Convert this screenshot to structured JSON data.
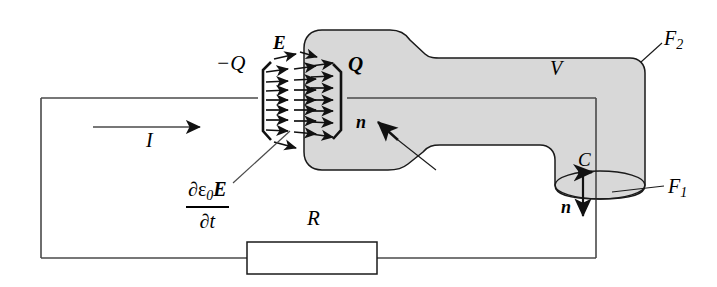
{
  "figure": {
    "type": "physics-circuit-diagram",
    "colors": {
      "line": "#1a1a1a",
      "volume_fill": "#d8d8d8",
      "background": "#ffffff"
    },
    "labels": {
      "charge_negative": "−Q",
      "charge_positive": "Q",
      "field": "E",
      "current": "I",
      "resistor": "R",
      "volume": "V",
      "surface_outer": "F",
      "surface_outer_sub": "2",
      "surface_inner": "F",
      "surface_inner_sub": "1",
      "curve": "C",
      "normal_upper": "n",
      "normal_lower": "n",
      "displacement_numerator_partial": "∂ε",
      "displacement_numerator_sub": "0",
      "displacement_numerator_field": "E",
      "displacement_denominator": "∂t"
    },
    "elements": [
      {
        "name": "circuit-loop",
        "shape": "rectangle",
        "role": "conducting wire loop"
      },
      {
        "name": "capacitor-plate-left",
        "charge": "−Q"
      },
      {
        "name": "capacitor-plate-right",
        "charge": "Q"
      },
      {
        "name": "electric-field-arrows",
        "count": 24,
        "direction": "left-to-right"
      },
      {
        "name": "resistor",
        "label": "R"
      },
      {
        "name": "current-arrow",
        "label": "I",
        "direction": "right"
      },
      {
        "name": "volume-region",
        "label": "V",
        "fill": "#d8d8d8"
      },
      {
        "name": "curve-c-ellipse",
        "label": "C",
        "orientation": "counterclockwise-from-above"
      },
      {
        "name": "normal-vector-upper",
        "label": "n",
        "direction": "up-right"
      },
      {
        "name": "normal-vector-lower",
        "label": "n",
        "direction": "down"
      }
    ]
  }
}
